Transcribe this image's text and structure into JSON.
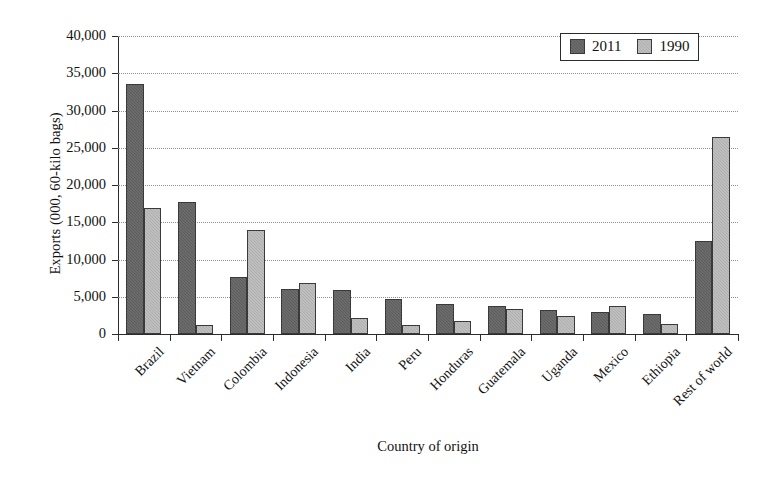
{
  "chart_data": {
    "type": "bar",
    "title": "",
    "xlabel": "Country of origin",
    "ylabel": "Exports (000, 60-kilo bags)",
    "ylim": [
      0,
      40000
    ],
    "ytick_values": [
      0,
      5000,
      10000,
      15000,
      20000,
      25000,
      30000,
      35000,
      40000
    ],
    "ytick_labels": [
      "0",
      "5,000",
      "10,000",
      "15,000",
      "20,000",
      "25,000",
      "30,000",
      "35,000",
      "40,000"
    ],
    "grid": "horizontal-dotted",
    "legend_position": "top-right",
    "categories": [
      "Brazil",
      "Vietnam",
      "Colombia",
      "Indonesia",
      "India",
      "Peru",
      "Honduras",
      "Guatemala",
      "Uganda",
      "Mexico",
      "Ethiopia",
      "Rest of world"
    ],
    "series": [
      {
        "name": "2011",
        "color": "#5b5b5b",
        "values": [
          33500,
          17700,
          7600,
          6100,
          5900,
          4700,
          4000,
          3800,
          3200,
          2900,
          2700,
          12500
        ]
      },
      {
        "name": "1990",
        "color": "#adadad",
        "values": [
          16900,
          1200,
          13900,
          6900,
          2100,
          1200,
          1800,
          3400,
          2400,
          3700,
          1300,
          26500
        ]
      }
    ]
  },
  "legend": {
    "entries": [
      {
        "label": "2011"
      },
      {
        "label": "1990"
      }
    ]
  }
}
